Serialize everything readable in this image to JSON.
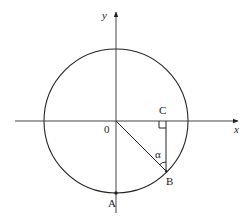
{
  "diagram": {
    "type": "unit-circle-geometry",
    "axes": {
      "x_label": "x",
      "y_label": "y",
      "origin_label": "0"
    },
    "points": {
      "A": "A",
      "B": "B",
      "C": "C"
    },
    "angle_label": "α",
    "stroke_color": "#222222",
    "background": "#ffffff"
  }
}
